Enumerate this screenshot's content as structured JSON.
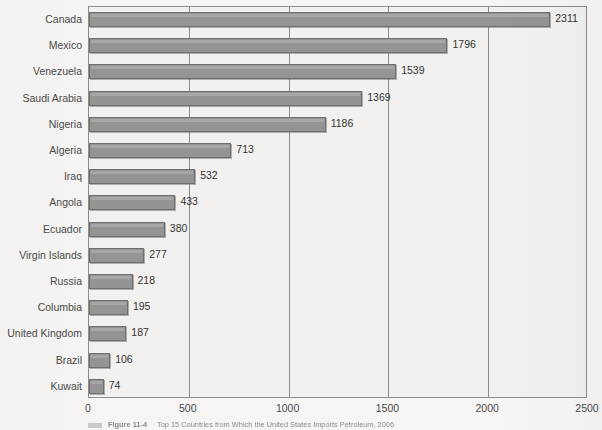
{
  "chart_data": {
    "type": "bar",
    "orientation": "horizontal",
    "title": "",
    "xlabel": "",
    "ylabel": "",
    "xlim": [
      0,
      2500
    ],
    "xticks": [
      0,
      500,
      1000,
      1500,
      2000,
      2500
    ],
    "xticklabels": [
      "0",
      "500",
      "1000",
      "1500",
      "2000",
      "2500"
    ],
    "grid": true,
    "grid_axis": "x",
    "legend": "none",
    "bar_color": "#949494",
    "bar_edge_color": "#6f6f6f",
    "value_labels": true,
    "categories": [
      "Canada",
      "Mexico",
      "Venezuela",
      "Saudi Arabia",
      "Nigeria",
      "Algeria",
      "Iraq",
      "Angola",
      "Ecuador",
      "Virgin Islands",
      "Russia",
      "Columbia",
      "United Kingdom",
      "Brazil",
      "Kuwait"
    ],
    "values": [
      2311,
      1796,
      1539,
      1369,
      1186,
      713,
      532,
      433,
      380,
      277,
      218,
      195,
      187,
      106,
      74
    ],
    "value_labels_text": [
      "2311",
      "1796",
      "1539",
      "1369",
      "1186",
      "713",
      "532",
      "433",
      "380",
      "277",
      "218",
      "195",
      "187",
      "106",
      "74"
    ]
  },
  "caption": {
    "figure_number": "Figure 11-4",
    "text": "Top 15 Countries from Which the United States Imports Petroleum, 2006"
  }
}
